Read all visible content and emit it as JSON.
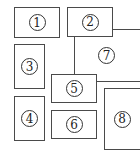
{
  "diagram": {
    "type": "region-layout",
    "regions": [
      {
        "id": "region-1",
        "label": "1"
      },
      {
        "id": "region-2",
        "label": "2"
      },
      {
        "id": "region-3",
        "label": "3"
      },
      {
        "id": "region-4",
        "label": "4"
      },
      {
        "id": "region-5",
        "label": "5"
      },
      {
        "id": "region-6",
        "label": "6"
      },
      {
        "id": "region-7",
        "label": "7"
      },
      {
        "id": "region-8",
        "label": "8"
      }
    ],
    "colors": {
      "stroke": "#4a4a4a",
      "background": "#ffffff",
      "text": "#222222"
    }
  }
}
